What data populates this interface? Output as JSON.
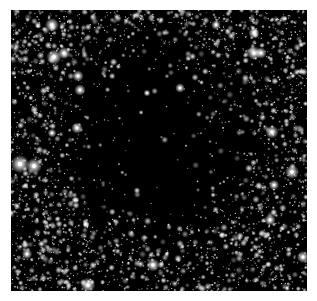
{
  "image": {
    "subject": "star field with dark molecular cloud",
    "background_color": "#ffffff",
    "field_color": "#000000",
    "frame": {
      "x": 11,
      "y": 10,
      "width": 296,
      "height": 281
    },
    "dark_cloud": {
      "cx": 155,
      "cy": 140,
      "rx": 110,
      "ry": 115
    },
    "star_color": "#ffffff",
    "bright_stars": [
      {
        "x": 52,
        "y": 25,
        "r": 3.2
      },
      {
        "x": 54,
        "y": 57,
        "r": 3.5
      },
      {
        "x": 64,
        "y": 53,
        "r": 2.8
      },
      {
        "x": 78,
        "y": 76,
        "r": 2.6
      },
      {
        "x": 80,
        "y": 90,
        "r": 2.6
      },
      {
        "x": 77,
        "y": 128,
        "r": 2.6
      },
      {
        "x": 52,
        "y": 133,
        "r": 2.0
      },
      {
        "x": 20,
        "y": 164,
        "r": 4.2
      },
      {
        "x": 34,
        "y": 166,
        "r": 3.6
      },
      {
        "x": 27,
        "y": 254,
        "r": 2.4
      },
      {
        "x": 88,
        "y": 285,
        "r": 3.4
      },
      {
        "x": 153,
        "y": 265,
        "r": 3.0
      },
      {
        "x": 216,
        "y": 25,
        "r": 2.2
      },
      {
        "x": 254,
        "y": 33,
        "r": 2.6
      },
      {
        "x": 254,
        "y": 53,
        "r": 3.2
      },
      {
        "x": 261,
        "y": 53,
        "r": 2.6
      },
      {
        "x": 272,
        "y": 132,
        "r": 3.0
      },
      {
        "x": 292,
        "y": 172,
        "r": 3.2
      },
      {
        "x": 274,
        "y": 185,
        "r": 2.4
      },
      {
        "x": 270,
        "y": 220,
        "r": 2.6
      },
      {
        "x": 303,
        "y": 257,
        "r": 2.8
      },
      {
        "x": 180,
        "y": 88,
        "r": 2.2
      },
      {
        "x": 147,
        "y": 93,
        "r": 1.6
      }
    ],
    "faint_star_count": 2600,
    "seed": 20240611
  }
}
